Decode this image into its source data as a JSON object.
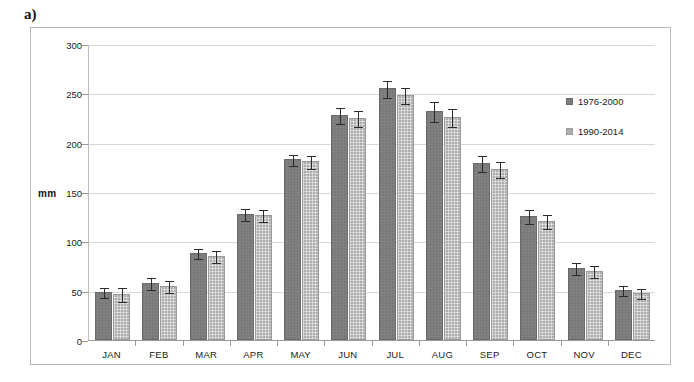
{
  "figure": {
    "panel_letter": "a)"
  },
  "chart_data": {
    "type": "bar",
    "title": "",
    "subtitle": "",
    "xlabel": "",
    "ylabel": "mm",
    "ylim": [
      0,
      300
    ],
    "yticks": [
      0,
      50,
      100,
      150,
      200,
      250,
      300
    ],
    "ytick_labels": [
      "0",
      "50",
      "100",
      "150",
      "200",
      "250",
      "300"
    ],
    "grid": true,
    "legend_position": "right",
    "categories": [
      "JAN",
      "FEB",
      "MAR",
      "APR",
      "MAY",
      "JUN",
      "JUL",
      "AUG",
      "SEP",
      "OCT",
      "NOV",
      "DEC"
    ],
    "series": [
      {
        "name": "1976-2000",
        "color": "#7d7d7d",
        "values": [
          49,
          58,
          88,
          128,
          183,
          228,
          255,
          232,
          179,
          126,
          73,
          51
        ],
        "errors": [
          5,
          6,
          5,
          6,
          6,
          8,
          9,
          10,
          8,
          7,
          6,
          5
        ]
      },
      {
        "name": "1990-2014",
        "color": "#adadad",
        "values": [
          47,
          55,
          85,
          127,
          181,
          225,
          248,
          226,
          173,
          121,
          70,
          48
        ],
        "errors": [
          7,
          6,
          6,
          6,
          7,
          8,
          8,
          9,
          8,
          7,
          6,
          5
        ]
      }
    ]
  }
}
